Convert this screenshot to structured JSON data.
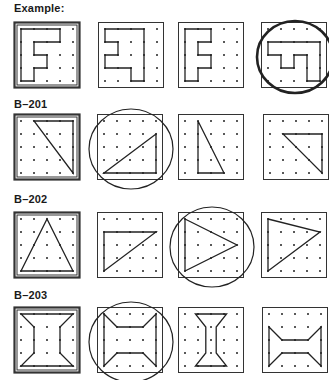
{
  "sections": [
    {
      "label": "Example:",
      "label_pos": [
        14,
        2
      ],
      "box_y": 22,
      "items": [
        {
          "x": 14,
          "target": true,
          "path": [
            [
              0,
              0
            ],
            [
              3,
              0
            ],
            [
              3,
              1
            ],
            [
              1,
              1
            ],
            [
              1,
              2
            ],
            [
              2,
              2
            ],
            [
              2,
              3
            ],
            [
              1,
              3
            ],
            [
              1,
              4
            ],
            [
              0,
              4
            ]
          ],
          "circled": false
        },
        {
          "x": 98,
          "target": false,
          "path": [
            [
              0,
              0
            ],
            [
              3,
              0
            ],
            [
              3,
              4
            ],
            [
              2,
              4
            ],
            [
              2,
              3
            ],
            [
              0,
              3
            ],
            [
              0,
              2
            ],
            [
              1,
              2
            ],
            [
              1,
              1
            ],
            [
              0,
              1
            ]
          ],
          "circled": false
        },
        {
          "x": 178,
          "target": false,
          "path": [
            [
              1,
              0
            ],
            [
              2,
              0
            ],
            [
              2,
              1
            ],
            [
              1,
              1
            ],
            [
              1,
              2
            ],
            [
              2,
              2
            ],
            [
              2,
              3
            ],
            [
              1,
              3
            ],
            [
              1,
              4
            ],
            [
              0,
              4
            ],
            [
              0,
              0
            ]
          ],
          "circled": false
        },
        {
          "x": 261,
          "target": false,
          "path": [
            [
              0,
              1
            ],
            [
              4,
              1
            ],
            [
              4,
              4
            ],
            [
              3,
              4
            ],
            [
              3,
              2
            ],
            [
              2,
              2
            ],
            [
              2,
              3
            ],
            [
              1,
              3
            ],
            [
              1,
              2
            ],
            [
              0,
              2
            ]
          ],
          "circled": true,
          "circle_bold": true
        }
      ]
    },
    {
      "label": "B–201",
      "label_pos": [
        14,
        98
      ],
      "box_y": 114,
      "items": [
        {
          "x": 14,
          "target": true,
          "path": [
            [
              1,
              0
            ],
            [
              4,
              0
            ],
            [
              4,
              4
            ]
          ],
          "circled": false
        },
        {
          "x": 97,
          "target": false,
          "path": [
            [
              0,
              4
            ],
            [
              4,
              1
            ],
            [
              4,
              4
            ]
          ],
          "circled": true
        },
        {
          "x": 178,
          "target": false,
          "path": [
            [
              1,
              0
            ],
            [
              1,
              4
            ],
            [
              3,
              4
            ]
          ],
          "circled": false
        },
        {
          "x": 263,
          "target": false,
          "path": [
            [
              1,
              1
            ],
            [
              4,
              1
            ],
            [
              4,
              4
            ]
          ],
          "circled": false
        }
      ]
    },
    {
      "label": "B–202",
      "label_pos": [
        14,
        193
      ],
      "box_y": 212,
      "items": [
        {
          "x": 14,
          "target": true,
          "path": [
            [
              0,
              4
            ],
            [
              2,
              0
            ],
            [
              4,
              4
            ]
          ],
          "circled": false
        },
        {
          "x": 97,
          "target": false,
          "path": [
            [
              0,
              1
            ],
            [
              4,
              1
            ],
            [
              0,
              4
            ]
          ],
          "circled": false
        },
        {
          "x": 178,
          "target": false,
          "path": [
            [
              0,
              0
            ],
            [
              4,
              2
            ],
            [
              0,
              4
            ]
          ],
          "circled": true
        },
        {
          "x": 261,
          "target": false,
          "path": [
            [
              0,
              0
            ],
            [
              4,
              1
            ],
            [
              0,
              4
            ]
          ],
          "circled": false
        }
      ]
    },
    {
      "label": "B–203",
      "label_pos": [
        14,
        289
      ],
      "box_y": 307,
      "items": [
        {
          "x": 14,
          "target": true,
          "path": [
            [
              0,
              0
            ],
            [
              4,
              0
            ],
            [
              3,
              1
            ],
            [
              3,
              3
            ],
            [
              4,
              4
            ],
            [
              0,
              4
            ],
            [
              1,
              3
            ],
            [
              1,
              1
            ]
          ],
          "circled": false
        },
        {
          "x": 97,
          "target": false,
          "path": [
            [
              0,
              0
            ],
            [
              1,
              1
            ],
            [
              3,
              1
            ],
            [
              4,
              0
            ],
            [
              4,
              4
            ],
            [
              3,
              3
            ],
            [
              1,
              3
            ],
            [
              0,
              4
            ]
          ],
          "circled": true
        },
        {
          "x": 178,
          "target": false,
          "path": [
            [
              0.8,
              0
            ],
            [
              3.2,
              0
            ],
            [
              2.4,
              1
            ],
            [
              2.4,
              3
            ],
            [
              3.2,
              4
            ],
            [
              0.8,
              4
            ],
            [
              1.6,
              3
            ],
            [
              1.6,
              1
            ]
          ],
          "circled": false
        },
        {
          "x": 262,
          "target": false,
          "path": [
            [
              0,
              1
            ],
            [
              1,
              2
            ],
            [
              3,
              2
            ],
            [
              4,
              1
            ],
            [
              4,
              4
            ],
            [
              3,
              3
            ],
            [
              1,
              3
            ],
            [
              0,
              4
            ]
          ],
          "circled": false
        }
      ]
    }
  ]
}
